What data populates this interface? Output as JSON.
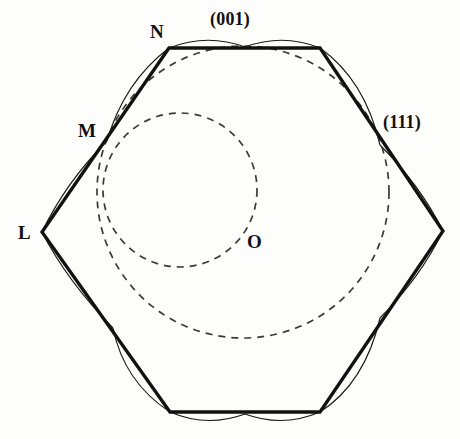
{
  "figure": {
    "background_color": "#fdfdfc",
    "line_color": "#111111",
    "dashed_color": "#3a3a3a",
    "thin_color": "#1a1a1a"
  },
  "labels": {
    "n": "N",
    "m": "M",
    "l": "L",
    "o": "O",
    "face_001": "(001)",
    "face_111": "(111)"
  },
  "geometry": {
    "hexagon": {
      "stroke_width": 3.2,
      "vertices": [
        {
          "name": "N",
          "x": 169,
          "y": 48
        },
        {
          "name": "top-right",
          "x": 320,
          "y": 48
        },
        {
          "name": "right",
          "x": 443,
          "y": 231
        },
        {
          "name": "bottom-right",
          "x": 320,
          "y": 412
        },
        {
          "name": "bottom-left",
          "x": 170,
          "y": 412
        },
        {
          "name": "L",
          "x": 42,
          "y": 232
        }
      ]
    },
    "arc_points": [
      {
        "name": "M",
        "x": 107,
        "y": 141
      },
      {
        "name": "111-point",
        "x": 380,
        "y": 145
      }
    ],
    "outer_arcs": {
      "stroke_width": 1.2,
      "count": 6,
      "bulge": 11,
      "description": "thin circular arcs bulging outward across each hexagon edge"
    },
    "dashed_circles": [
      {
        "name": "left-circle",
        "cx": 180,
        "cy": 190,
        "r": 77,
        "stroke_width": 1.6,
        "dash": "7 6"
      },
      {
        "name": "right-circle",
        "cx": 243,
        "cy": 192,
        "r": 146,
        "stroke_width": 1.6,
        "dash": "7 6"
      }
    ],
    "intersection": {
      "name": "O",
      "x": 243,
      "y": 240
    }
  }
}
